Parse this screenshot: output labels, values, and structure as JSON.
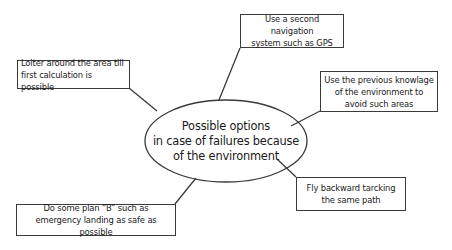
{
  "diagram": {
    "type": "mind-map",
    "center": {
      "label": "Possible options\nin case of failures because\nof the environment"
    },
    "options": [
      {
        "id": "loiter",
        "label": "Loiter around the area till\nfirst calculation is  possible"
      },
      {
        "id": "gps",
        "label": "Use a second navigation\nsystem such as GPS"
      },
      {
        "id": "knowledge",
        "label": "Use the previous knowlage\nof the environment to\navoid such areas"
      },
      {
        "id": "fly-back",
        "label": "Fly backward tarcking\nthe same path"
      },
      {
        "id": "plan-b",
        "label": "Do some plan “B” such as\nemergency landing as safe as possible"
      }
    ],
    "colors": {
      "stroke": "#3a3a3a",
      "text": "#1a1a1a",
      "background": "#ffffff"
    }
  }
}
